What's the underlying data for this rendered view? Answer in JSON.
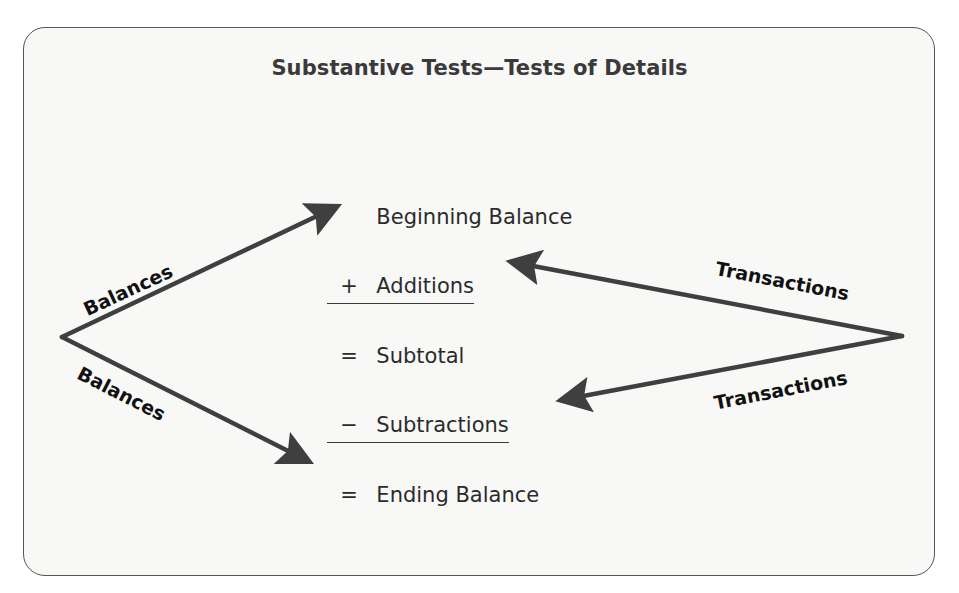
{
  "figure": {
    "title": "Substantive Tests—Tests of Details",
    "rollforward": [
      {
        "operator": "",
        "label": "Beginning Balance",
        "underlined": false
      },
      {
        "operator": "+",
        "label": "Additions",
        "underlined": true
      },
      {
        "operator": "=",
        "label": "Subtotal",
        "underlined": false
      },
      {
        "operator": "−",
        "label": "Subtractions",
        "underlined": true
      },
      {
        "operator": "=",
        "label": "Ending Balance",
        "underlined": false
      }
    ],
    "arrow_labels": {
      "balances_upper": "Balances",
      "balances_lower": "Balances",
      "transactions_upper": "Transactions",
      "transactions_lower": "Transactions"
    },
    "arrows": [
      {
        "from": "balances-origin",
        "to": "Beginning Balance",
        "label": "Balances"
      },
      {
        "from": "balances-origin",
        "to": "Ending Balance",
        "label": "Balances"
      },
      {
        "from": "transactions-origin",
        "to": "Additions",
        "label": "Transactions"
      },
      {
        "from": "transactions-origin",
        "to": "Subtractions",
        "label": "Transactions"
      }
    ],
    "colors": {
      "arrow": "#3f3f3f",
      "text": "#2b2b2b",
      "panel_background": "#f8f8f7",
      "panel_border": "#555555"
    }
  }
}
